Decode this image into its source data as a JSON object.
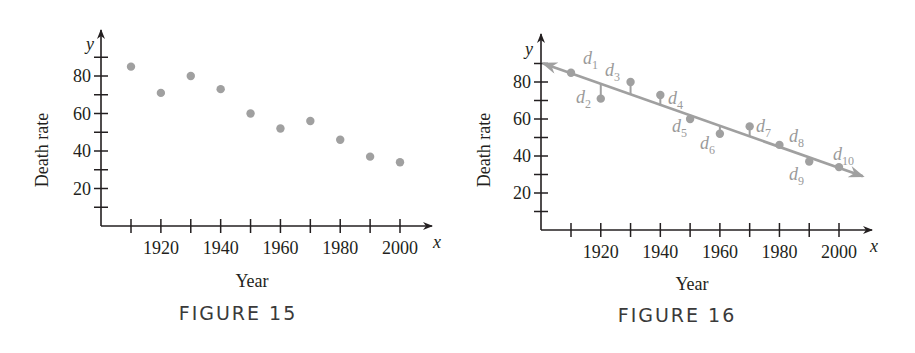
{
  "figures": [
    {
      "caption": "FIGURE 15",
      "xlabel": "Year",
      "ylabel": "Death rate",
      "x_var": "x",
      "y_var": "y",
      "x_tick_labels": [
        "1920",
        "1940",
        "1960",
        "1980",
        "2000"
      ],
      "y_tick_labels": [
        "20",
        "40",
        "60",
        "80"
      ]
    },
    {
      "caption": "FIGURE 16",
      "xlabel": "Year",
      "ylabel": "Death rate",
      "x_var": "x",
      "y_var": "y",
      "x_tick_labels": [
        "1920",
        "1940",
        "1960",
        "1980",
        "2000"
      ],
      "y_tick_labels": [
        "20",
        "40",
        "60",
        "80"
      ],
      "residual_labels": [
        "1",
        "2",
        "3",
        "4",
        "5",
        "6",
        "7",
        "8",
        "9",
        "10"
      ],
      "residual_symbol": "d"
    }
  ],
  "colors": {
    "axis": "#231f20",
    "points": "#a0a0a0",
    "line": "#a0a0a0",
    "caption": "#3a3a3a"
  },
  "chart_data": [
    {
      "type": "scatter",
      "title": "FIGURE 15",
      "xlabel": "Year",
      "ylabel": "Death rate",
      "x": [
        1910,
        1920,
        1930,
        1940,
        1950,
        1960,
        1970,
        1980,
        1990,
        2000
      ],
      "y": [
        85,
        71,
        80,
        73,
        60,
        52,
        56,
        46,
        37,
        34
      ],
      "x_ticks": [
        1920,
        1940,
        1960,
        1980,
        2000
      ],
      "y_ticks": [
        20,
        40,
        60,
        80
      ],
      "xlim": [
        1900,
        2010
      ],
      "ylim": [
        0,
        95
      ],
      "grid": false,
      "legend": null
    },
    {
      "type": "scatter",
      "title": "FIGURE 16",
      "xlabel": "Year",
      "ylabel": "Death rate",
      "x": [
        1910,
        1920,
        1930,
        1940,
        1950,
        1960,
        1970,
        1980,
        1990,
        2000
      ],
      "y": [
        85,
        71,
        80,
        73,
        60,
        52,
        56,
        46,
        37,
        34
      ],
      "x_ticks": [
        1920,
        1940,
        1960,
        1980,
        2000
      ],
      "y_ticks": [
        20,
        40,
        60,
        80
      ],
      "xlim": [
        1900,
        2010
      ],
      "ylim": [
        0,
        95
      ],
      "grid": false,
      "fit_line": {
        "x": [
          1900,
          2008
        ],
        "y": [
          90,
          29
        ],
        "style": "double-arrow"
      },
      "annotations": [
        "d1",
        "d2",
        "d3",
        "d4",
        "d5",
        "d6",
        "d7",
        "d8",
        "d9",
        "d10"
      ],
      "legend": null
    }
  ]
}
